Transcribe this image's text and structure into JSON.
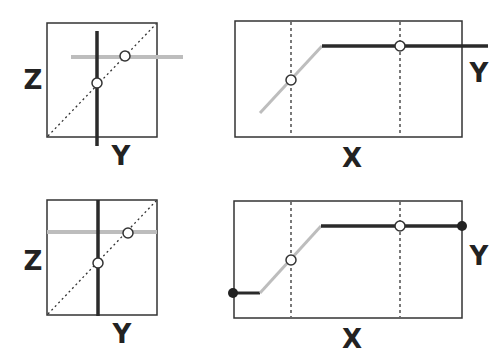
{
  "colors": {
    "frame": "#333333",
    "dark_line": "#2a2a2a",
    "light_line": "#bdbdbd",
    "dashed": "#333333",
    "circle_fill": "#ffffff",
    "filled_dot": "#222222"
  },
  "panels": [
    {
      "id": "top-left",
      "type": "z-vs-y",
      "x_label": "Y",
      "y_label": "Z"
    },
    {
      "id": "top-right",
      "type": "y-vs-x",
      "x_label": "X",
      "y_label": "Y"
    },
    {
      "id": "bottom-left",
      "type": "z-vs-y",
      "x_label": "Y",
      "y_label": "Z"
    },
    {
      "id": "bottom-right",
      "type": "y-vs-x",
      "x_label": "X",
      "y_label": "Y"
    }
  ]
}
